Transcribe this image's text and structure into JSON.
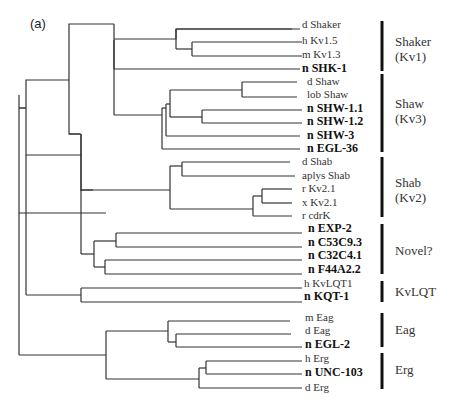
{
  "panel_label": "(a)",
  "leaves": [
    {
      "label": "d Shaker",
      "y": 25,
      "bold": false
    },
    {
      "label": "h Kv1.5",
      "y": 41,
      "bold": false
    },
    {
      "label": "m Kv1.3",
      "y": 55,
      "bold": false
    },
    {
      "label": "n SHK-1",
      "y": 69,
      "bold": true
    },
    {
      "label": "d Shaw",
      "y": 82,
      "bold": false
    },
    {
      "label": "lob Shaw",
      "y": 95,
      "bold": false
    },
    {
      "label": "n SHW-1.1",
      "y": 109,
      "bold": true
    },
    {
      "label": "n SHW-1.2",
      "y": 122,
      "bold": true
    },
    {
      "label": "n SHW-3",
      "y": 136,
      "bold": true
    },
    {
      "label": "n EGL-36",
      "y": 149,
      "bold": true
    },
    {
      "label": "d Shab",
      "y": 162,
      "bold": false
    },
    {
      "label": "aplys Shab",
      "y": 176,
      "bold": false
    },
    {
      "label": "r Kv2.1",
      "y": 189,
      "bold": false
    },
    {
      "label": "x Kv2.1",
      "y": 203,
      "bold": false
    },
    {
      "label": "r cdrK",
      "y": 216,
      "bold": false
    },
    {
      "label": "n EXP-2",
      "y": 229,
      "bold": true
    },
    {
      "label": "n C53C9.3",
      "y": 243,
      "bold": true
    },
    {
      "label": "n C32C4.1",
      "y": 256,
      "bold": true
    },
    {
      "label": "n F44A2.2",
      "y": 270,
      "bold": true
    },
    {
      "label": "h KvLQT1",
      "y": 284,
      "bold": false
    },
    {
      "label": "n KQT-1",
      "y": 297,
      "bold": true
    },
    {
      "label": "m Eag",
      "y": 318,
      "bold": false
    },
    {
      "label": "d Eag",
      "y": 331,
      "bold": false
    },
    {
      "label": "n EGL-2",
      "y": 345,
      "bold": true
    },
    {
      "label": "h Erg",
      "y": 359,
      "bold": false
    },
    {
      "label": "n UNC-103",
      "y": 373,
      "bold": true
    },
    {
      "label": "d Erg",
      "y": 388,
      "bold": false
    }
  ],
  "groups": [
    {
      "label_line1": "Shaker",
      "label_line2": "(Kv1)",
      "bar_top": 21,
      "bar_bottom": 71,
      "label_y": 34
    },
    {
      "label_line1": "Shaw",
      "label_line2": "(Kv3)",
      "bar_top": 74,
      "bar_bottom": 152,
      "label_y": 96
    },
    {
      "label_line1": "Shab",
      "label_line2": "(Kv2)",
      "bar_top": 157,
      "bar_bottom": 217,
      "label_y": 175
    },
    {
      "label_line1": "Novel?",
      "label_line2": "",
      "bar_top": 224,
      "bar_bottom": 274,
      "label_y": 243
    },
    {
      "label_line1": "KvLQT",
      "label_line2": "",
      "bar_top": 281,
      "bar_bottom": 302,
      "label_y": 284
    },
    {
      "label_line1": "Eag",
      "label_line2": "",
      "bar_top": 313,
      "bar_bottom": 347,
      "label_y": 322
    },
    {
      "label_line1": "Erg",
      "label_line2": "",
      "bar_top": 353,
      "bar_bottom": 389,
      "label_y": 362
    }
  ],
  "tree_edges": [
    [
      19,
      95,
      26,
      95
    ],
    [
      19,
      95,
      19,
      215
    ],
    [
      26,
      95,
      26,
      215
    ],
    [
      26,
      95,
      26,
      55
    ],
    [
      26,
      95,
      80,
      95
    ],
    [
      26,
      55,
      69,
      55
    ],
    [
      69,
      55,
      69,
      80
    ],
    [
      69,
      55,
      69,
      35
    ],
    [
      69,
      35,
      115,
      35
    ],
    [
      69,
      35,
      115,
      69
    ],
    [
      115,
      35,
      115,
      69
    ],
    [
      115,
      35,
      176,
      35
    ],
    [
      115,
      35,
      115,
      29
    ],
    [
      176,
      29,
      176,
      49
    ],
    [
      176,
      29,
      255,
      29
    ],
    [
      176,
      49,
      192,
      49
    ],
    [
      192,
      42,
      192,
      56
    ],
    [
      192,
      42,
      300,
      42
    ],
    [
      192,
      56,
      300,
      56
    ],
    [
      115,
      69,
      300,
      69
    ],
    [
      176,
      29,
      300,
      29
    ],
    [
      69,
      80,
      81,
      80
    ],
    [
      81,
      71,
      81,
      106
    ],
    [
      81,
      71,
      170,
      71
    ],
    [
      170,
      71,
      170,
      90
    ],
    [
      170,
      90,
      170,
      117
    ],
    [
      170,
      90,
      202,
      90
    ],
    [
      202,
      90,
      202,
      118
    ],
    [
      202,
      90,
      242,
      90
    ],
    [
      202,
      118,
      215,
      118
    ],
    [
      242,
      84,
      242,
      97
    ],
    [
      242,
      84,
      300,
      84
    ],
    [
      242,
      97,
      300,
      97
    ],
    [
      215,
      111,
      215,
      125
    ],
    [
      215,
      111,
      300,
      111
    ],
    [
      215,
      125,
      300,
      125
    ],
    [
      166,
      117,
      166,
      146
    ],
    [
      166,
      117,
      170,
      117
    ],
    [
      166,
      132,
      300,
      132
    ],
    [
      166,
      146,
      300,
      146
    ],
    [
      81,
      106,
      170,
      106
    ]
  ]
}
